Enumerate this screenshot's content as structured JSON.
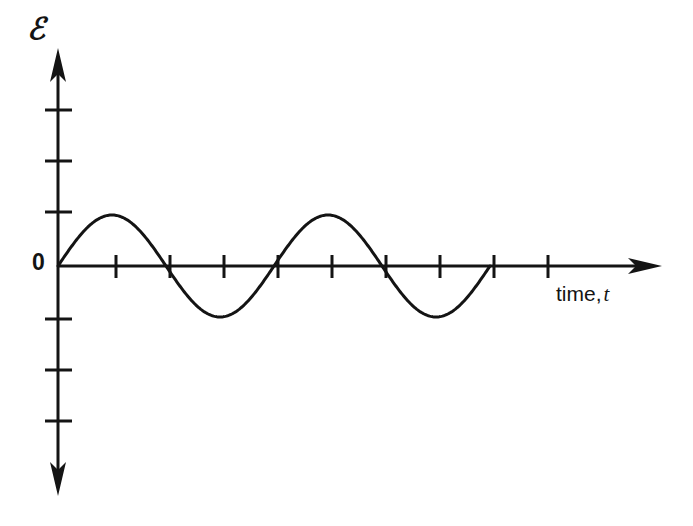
{
  "figure": {
    "kind": "line-plot",
    "background_color": "#ffffff",
    "ink_color": "#141414",
    "y_axis": {
      "label": "ℰ",
      "label_name": "emf-symbol",
      "origin_label": "0",
      "ticks_above_origin": 3,
      "ticks_below_origin": 3,
      "arrowhead": "up"
    },
    "x_axis": {
      "label_prefix": "time,",
      "label_variable": "t",
      "tick_count": 10,
      "arrowhead": "right"
    }
  },
  "chart_data": {
    "type": "line",
    "title": "",
    "xlabel": "time, t",
    "ylabel": "ℰ",
    "grid": false,
    "legend": null,
    "x_tick_labels": [
      "",
      "",
      "",
      "",
      "",
      "",
      "",
      "",
      "",
      ""
    ],
    "y_tick_labels": [
      "",
      "",
      "",
      "0",
      "",
      "",
      ""
    ],
    "xlim": [
      0,
      10.5
    ],
    "ylim": [
      -3,
      3
    ],
    "annotations": [
      "0"
    ],
    "series": [
      {
        "name": "emf",
        "description": "sinusoidal emf, 2 full cycles, amplitude 1 tick unit, zero at t=0",
        "amplitude": 1,
        "cycles": 2,
        "period_ticks": 4,
        "x": [
          0.0,
          0.25,
          0.5,
          0.75,
          1.0,
          1.25,
          1.5,
          1.75,
          2.0,
          2.25,
          2.5,
          2.75,
          3.0,
          3.25,
          3.5,
          3.75,
          4.0,
          4.25,
          4.5,
          4.75,
          5.0,
          5.25,
          5.5,
          5.75,
          6.0,
          6.25,
          6.5,
          6.75,
          7.0,
          7.25,
          7.5,
          7.75,
          8.0
        ],
        "y": [
          0.0,
          0.383,
          0.707,
          0.924,
          1.0,
          0.924,
          0.707,
          0.383,
          0.0,
          -0.383,
          -0.707,
          -0.924,
          -1.0,
          -0.924,
          -0.707,
          -0.383,
          0.0,
          0.383,
          0.707,
          0.924,
          1.0,
          0.924,
          0.707,
          0.383,
          0.0,
          -0.383,
          -0.707,
          -0.924,
          -1.0,
          -0.924,
          -0.707,
          -0.383,
          0.0
        ]
      }
    ]
  }
}
